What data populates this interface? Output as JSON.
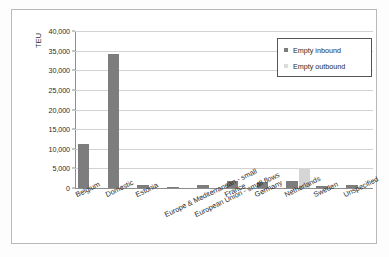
{
  "chart_data": {
    "type": "bar",
    "title": "",
    "subtitle": "",
    "xlabel": "",
    "ylabel": "TEU",
    "ylim": [
      0,
      40000
    ],
    "yticks": [
      0,
      5000,
      10000,
      15000,
      20000,
      25000,
      30000,
      35000,
      40000
    ],
    "ytick_labels": [
      "0",
      "5,000",
      "10,000",
      "15,000",
      "20,000",
      "25,000",
      "30,000",
      "35,000",
      "40,000"
    ],
    "grid": "horizontal",
    "legend_position": "top-right",
    "categories": [
      "Belgium",
      "Domestic",
      "Estonia",
      "Europe & Mediterranean - small",
      "European Union - small flows",
      "France",
      "Germany",
      "Netherlands",
      "Sweden",
      "Unspecified"
    ],
    "series": [
      {
        "name": "Empty inbound",
        "color": "#7d7d7d",
        "values": [
          11200,
          34200,
          850,
          300,
          800,
          1900,
          1600,
          1900,
          600,
          800
        ]
      },
      {
        "name": "Empty outbound",
        "color": "#d5d5d5",
        "values": [
          0,
          0,
          0,
          0,
          0,
          0,
          0,
          5200,
          0,
          0
        ]
      }
    ]
  },
  "legend": {
    "items": [
      {
        "label": "Empty inbound",
        "marker": "square-dark"
      },
      {
        "label": "Empty outbound",
        "marker": "square-light"
      }
    ]
  },
  "axis": {
    "y_title": "TEU"
  }
}
